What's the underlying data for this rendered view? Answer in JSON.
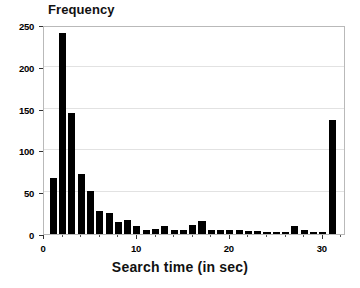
{
  "chart_data": {
    "type": "bar",
    "title": "",
    "xlabel": "Search time (in sec)",
    "ylabel": "Frequency",
    "xlim": [
      0,
      32.5
    ],
    "ylim": [
      0,
      250
    ],
    "grid": true,
    "legend": false,
    "bin_width": 1,
    "xticks": [
      0,
      10,
      20,
      30
    ],
    "xtick_labels": [
      "0",
      "10",
      "20",
      "30"
    ],
    "yticks": [
      0,
      50,
      100,
      150,
      200,
      250
    ],
    "ytick_labels": [
      "0",
      "50",
      "100",
      "150",
      "200",
      "250"
    ],
    "categories": [
      "1",
      "2",
      "3",
      "4",
      "5",
      "6",
      "7",
      "8",
      "9",
      "10",
      "11",
      "12",
      "13",
      "14",
      "15",
      "16",
      "17",
      "18",
      "19",
      "20",
      "21",
      "22",
      "23",
      "24",
      "25",
      "26",
      "27",
      "28",
      "29",
      "30",
      "31"
    ],
    "x": [
      1,
      2,
      3,
      4,
      5,
      6,
      7,
      8,
      9,
      10,
      11,
      12,
      13,
      14,
      15,
      16,
      17,
      18,
      19,
      20,
      21,
      22,
      23,
      24,
      25,
      26,
      27,
      28,
      29,
      30,
      31
    ],
    "values": [
      67,
      241,
      145,
      72,
      51,
      27,
      25,
      14,
      17,
      9,
      5,
      6,
      9,
      5,
      5,
      11,
      15,
      5,
      5,
      5,
      5,
      4,
      4,
      3,
      3,
      2,
      9,
      5,
      3,
      2,
      136
    ],
    "series": [
      {
        "name": "Frequency",
        "color": "#000000",
        "values": [
          67,
          241,
          145,
          72,
          51,
          27,
          25,
          14,
          17,
          9,
          5,
          6,
          9,
          5,
          5,
          11,
          15,
          5,
          5,
          5,
          5,
          4,
          4,
          3,
          3,
          2,
          9,
          5,
          3,
          2,
          136
        ]
      }
    ]
  },
  "colors": {
    "bar": "#000000",
    "grid": "#e2e2e2",
    "frame": "#b9b9b9",
    "text": "#000000",
    "background": "#ffffff"
  }
}
